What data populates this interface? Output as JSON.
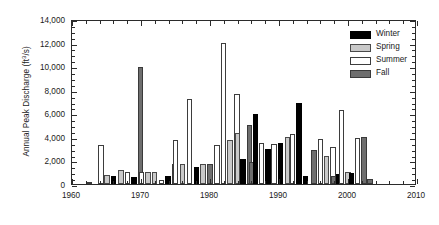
{
  "chart_data": {
    "type": "bar",
    "title": "",
    "subtitle": "",
    "xlabel": "",
    "ylabel": "Annual Peak Discharge (ft³/s)",
    "ylabel_parts": {
      "prefix": "Annual Peak Discharge (ft",
      "sup": "3",
      "suffix": "/s)"
    },
    "xlim": [
      1960,
      2010
    ],
    "ylim": [
      0,
      14000
    ],
    "y_ticks": [
      0,
      2000,
      4000,
      6000,
      8000,
      10000,
      12000,
      14000
    ],
    "y_tick_labels": [
      "0",
      "2,000",
      "4,000",
      "6,000",
      "8,000",
      "10,000",
      "12,000",
      "14,000"
    ],
    "y_minor_interval": 500,
    "x_ticks": [
      1960,
      1970,
      1980,
      1990,
      2000,
      2010
    ],
    "x_tick_labels": [
      "1960",
      "1970",
      "1980",
      "1990",
      "2000",
      "2010"
    ],
    "x_minor_interval": 2,
    "grid": false,
    "legend_position": "upper-right-inside",
    "bar_width_years": 0.78,
    "series": [
      {
        "name": "Winter",
        "color": "#000000",
        "points": [
          {
            "x": 1966.0,
            "y": 660
          },
          {
            "x": 1969.0,
            "y": 600
          },
          {
            "x": 1973.9,
            "y": 680
          },
          {
            "x": 1978.0,
            "y": 1430
          },
          {
            "x": 1984.8,
            "y": 2150
          },
          {
            "x": 1986.6,
            "y": 5900
          },
          {
            "x": 1988.4,
            "y": 3000
          },
          {
            "x": 1990.2,
            "y": 3500
          },
          {
            "x": 1992.9,
            "y": 6900
          },
          {
            "x": 1993.8,
            "y": 700
          },
          {
            "x": 1998.7,
            "y": 850
          },
          {
            "x": 2000.5,
            "y": 900
          }
        ]
      },
      {
        "name": "Spring",
        "color": "#c9c9c9",
        "points": [
          {
            "x": 1965.1,
            "y": 740
          },
          {
            "x": 1967.1,
            "y": 1220
          },
          {
            "x": 1971.0,
            "y": 1020
          },
          {
            "x": 1972.0,
            "y": 1030
          },
          {
            "x": 1976.0,
            "y": 1700
          },
          {
            "x": 1979.0,
            "y": 1720
          },
          {
            "x": 1982.9,
            "y": 3700
          },
          {
            "x": 1984.0,
            "y": 4350
          },
          {
            "x": 1991.2,
            "y": 3950
          },
          {
            "x": 1996.9,
            "y": 2400
          },
          {
            "x": 2000.0,
            "y": 1030
          }
        ]
      },
      {
        "name": "Summer",
        "color": "#ffffff",
        "points": [
          {
            "x": 1964.2,
            "y": 3350
          },
          {
            "x": 1968.0,
            "y": 1010
          },
          {
            "x": 1970.1,
            "y": 1000
          },
          {
            "x": 1973.0,
            "y": 320
          },
          {
            "x": 1975.0,
            "y": 3700
          },
          {
            "x": 1977.0,
            "y": 7200
          },
          {
            "x": 1978.9,
            "y": 830
          },
          {
            "x": 1981.0,
            "y": 3320
          },
          {
            "x": 1982.0,
            "y": 12000
          },
          {
            "x": 1983.9,
            "y": 7600
          },
          {
            "x": 1987.5,
            "y": 3450
          },
          {
            "x": 1989.3,
            "y": 3400
          },
          {
            "x": 1992.0,
            "y": 4250
          },
          {
            "x": 1996.0,
            "y": 3800
          },
          {
            "x": 1997.8,
            "y": 3100
          },
          {
            "x": 1999.1,
            "y": 6300
          },
          {
            "x": 2001.4,
            "y": 3900
          }
        ]
      },
      {
        "name": "Fall",
        "color": "#6e6e6e",
        "points": [
          {
            "x": 1962.5,
            "y": 90
          },
          {
            "x": 1969.9,
            "y": 9900
          },
          {
            "x": 1974.9,
            "y": 1700
          },
          {
            "x": 1980.0,
            "y": 1700
          },
          {
            "x": 1985.7,
            "y": 5000
          },
          {
            "x": 1986.1,
            "y": 1900
          },
          {
            "x": 1995.1,
            "y": 2900
          },
          {
            "x": 1997.9,
            "y": 700
          },
          {
            "x": 2002.3,
            "y": 4000
          },
          {
            "x": 2003.2,
            "y": 430
          }
        ]
      }
    ]
  },
  "legend": {
    "entries": [
      {
        "label": "Winter",
        "series_key": "winter"
      },
      {
        "label": "Spring",
        "series_key": "spring"
      },
      {
        "label": "Summer",
        "series_key": "summer"
      },
      {
        "label": "Fall",
        "series_key": "fall"
      }
    ]
  }
}
